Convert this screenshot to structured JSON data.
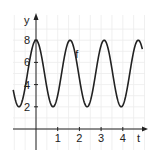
{
  "chart_data": {
    "type": "line",
    "title": "",
    "xlabel": "t",
    "ylabel": "y",
    "xlim": [
      -1.05,
      4.9
    ],
    "ylim": [
      -0.8,
      8.9
    ],
    "grid": true,
    "x_ticks": [
      1,
      2,
      3,
      4
    ],
    "x_tick_labels": [
      "1",
      "2",
      "3",
      "4"
    ],
    "y_ticks": [
      2,
      4,
      6,
      8
    ],
    "y_tick_labels": [
      "2",
      "4",
      "6",
      "8"
    ],
    "series": [
      {
        "name": "f",
        "function": "5 + 3*cos(4*t)",
        "t_range": [
          -1.05,
          4.9
        ],
        "max": 8,
        "min": 2,
        "period": 1.57,
        "color": "#222222"
      }
    ],
    "annotations": [
      {
        "text": "f",
        "x": 1.9,
        "y": 6.8
      }
    ]
  }
}
